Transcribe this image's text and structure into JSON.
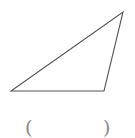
{
  "diagram": {
    "shape": "triangle",
    "vertices": [
      {
        "x": 11,
        "y": 91
      },
      {
        "x": 104,
        "y": 91
      },
      {
        "x": 123,
        "y": 12
      }
    ],
    "stroke_color": "#555555",
    "stroke_width": 1.1
  },
  "answer_blank": {
    "left_paren": "(",
    "right_paren": ")",
    "value": ""
  }
}
